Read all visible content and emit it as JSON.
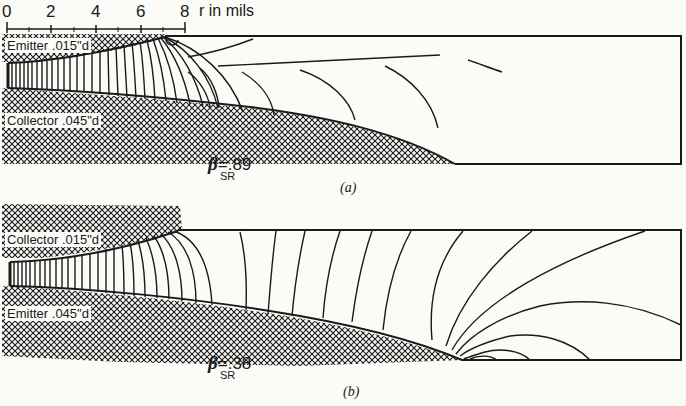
{
  "scale": {
    "ticks": [
      "0",
      "2",
      "4",
      "6",
      "8"
    ],
    "unit_label": "r in mils"
  },
  "panel_a": {
    "top_region": "Emitter .015\"d",
    "bottom_region": "Collector .045\"d",
    "beta_symbol": "β",
    "beta_subscript": "SR",
    "beta_value": "=.89",
    "caption": "(a)"
  },
  "panel_b": {
    "top_region": "Collector .015\"d",
    "bottom_region": "Emitter .045\"d",
    "beta_symbol": "β",
    "beta_subscript": "SR",
    "beta_value": "=.38",
    "caption": "(b)"
  },
  "colors": {
    "ink": "#1a1a1a",
    "paper": "#fbfbf8"
  }
}
